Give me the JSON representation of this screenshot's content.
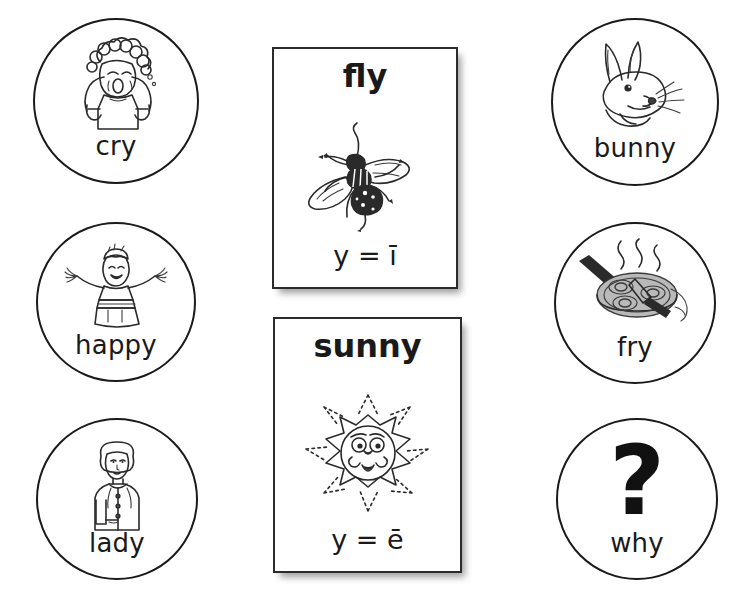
{
  "worksheet": {
    "title": "Y as a vowel picture sort",
    "background_color": "#ffffff",
    "ink_color": "#1a1a1a"
  },
  "left_tokens": [
    {
      "label": "cry",
      "icon": "crying-child-icon",
      "sound": "long-i"
    },
    {
      "label": "happy",
      "icon": "cheering-child-icon",
      "sound": "long-e"
    },
    {
      "label": "lady",
      "icon": "woman-icon",
      "sound": "long-e"
    }
  ],
  "right_tokens": [
    {
      "label": "bunny",
      "icon": "rabbit-head-icon",
      "sound": "long-e"
    },
    {
      "label": "fry",
      "icon": "frying-pan-icon",
      "sound": "long-i"
    },
    {
      "label": "why",
      "icon": "question-mark-icon",
      "sound": "long-i",
      "glyph": "?"
    }
  ],
  "cards": [
    {
      "word_stem": "fl",
      "word_y": "y",
      "word_full": "fly",
      "icon": "housefly-icon",
      "rule": "y = ī",
      "rule_plain": "y = long i"
    },
    {
      "word_stem": "sunn",
      "word_y": "y",
      "word_full": "sunny",
      "icon": "smiling-sun-icon",
      "rule": "y = ē",
      "rule_plain": "y = long e"
    }
  ]
}
